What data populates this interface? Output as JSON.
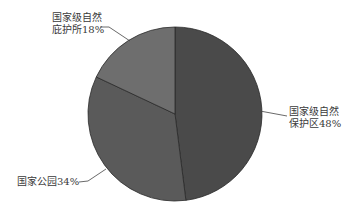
{
  "chart_data": {
    "type": "pie",
    "title": "",
    "categories": [
      "国家级自然保护区",
      "国家公园",
      "国家级自然庇护所"
    ],
    "values": [
      48,
      34,
      18
    ],
    "unit": "%",
    "colors": [
      "#4a4a4a",
      "#5a5a5a",
      "#6e6e6e"
    ],
    "start_angle": "12 o'clock, clockwise",
    "labels": [
      {
        "line1": "国家级自然",
        "line2": "保护区48%"
      },
      {
        "line1": "国家公园34%",
        "line2": ""
      },
      {
        "line1": "国家级自然",
        "line2": "庇护所18%"
      }
    ]
  }
}
